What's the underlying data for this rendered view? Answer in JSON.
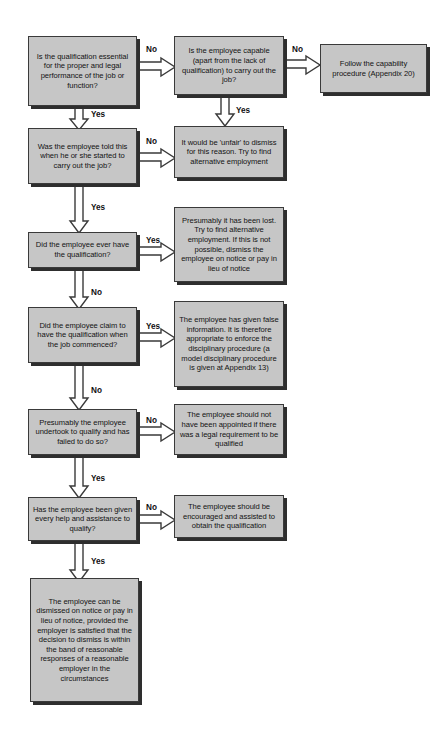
{
  "diagram": {
    "style": {
      "node_fill": "#c6c6c6",
      "node_border": "#3a3a3a",
      "node_shadow": "#2e2e2e",
      "arrow_fill": "#ffffff",
      "arrow_stroke": "#3a3a3a",
      "text_color": "#131313",
      "background": "#ffffff"
    },
    "nodes": [
      {
        "id": "q1",
        "type": "decision",
        "text": "Is the qualification essential for the proper and legal performance of the job or function?",
        "x": 28,
        "y": 36,
        "w": 109,
        "h": 70
      },
      {
        "id": "q2",
        "type": "decision",
        "text": "Is the employee capable (apart from the lack of qualification) to carry out the job?",
        "x": 174,
        "y": 36,
        "w": 110,
        "h": 59
      },
      {
        "id": "r1",
        "type": "outcome",
        "text": "Follow the capability procedure (Appendix 20)",
        "x": 320,
        "y": 44,
        "w": 107,
        "h": 49
      },
      {
        "id": "q3",
        "type": "decision",
        "text": "Was the employee told this when he or she started to carry out the job?",
        "x": 28,
        "y": 128,
        "w": 109,
        "h": 56
      },
      {
        "id": "r2",
        "type": "outcome",
        "text": "It would be 'unfair' to dismiss for this reason. Try to find alternative employment",
        "x": 174,
        "y": 126,
        "w": 110,
        "h": 52
      },
      {
        "id": "q4",
        "type": "decision",
        "text": "Did the employee ever have the qualification?",
        "x": 28,
        "y": 232,
        "w": 109,
        "h": 36
      },
      {
        "id": "r3",
        "type": "outcome",
        "text": "Presumably it has been lost. Try to find alternative employment. If this is not possible, dismiss the employee on notice or pay in lieu of notice",
        "x": 174,
        "y": 207,
        "w": 110,
        "h": 75
      },
      {
        "id": "q5",
        "type": "decision",
        "text": "Did the employee claim to have the qualification when the job commenced?",
        "x": 28,
        "y": 307,
        "w": 109,
        "h": 56
      },
      {
        "id": "r4",
        "type": "outcome",
        "text": "The employee has given false information. It is therefore appropriate to enforce the disciplinary procedure (a model disciplinary procedure is given at Appendix 13)",
        "x": 174,
        "y": 301,
        "w": 110,
        "h": 86
      },
      {
        "id": "q6",
        "type": "decision",
        "text": "Presumably the employee undertook to qualify and has failed to do so?",
        "x": 28,
        "y": 409,
        "w": 109,
        "h": 46
      },
      {
        "id": "r5",
        "type": "outcome",
        "text": "The employee should not have been appointed if there was a legal requirement to be qualified",
        "x": 174,
        "y": 404,
        "w": 110,
        "h": 51
      },
      {
        "id": "q7",
        "type": "decision",
        "text": "Has the employee been given every help and assistance to qualify?",
        "x": 28,
        "y": 497,
        "w": 109,
        "h": 44
      },
      {
        "id": "r6",
        "type": "outcome",
        "text": "The employee should be encouraged and assisted to obtain the qualification",
        "x": 174,
        "y": 495,
        "w": 110,
        "h": 43
      },
      {
        "id": "r7",
        "type": "outcome",
        "text": "The employee can be dismissed on notice or pay in lieu of notice, provided the employer is satisfied that the decision to dismiss is within the band of reasonable responses of a reasonable employer in the circumstances",
        "x": 30,
        "y": 578,
        "w": 109,
        "h": 124
      }
    ],
    "edges": [
      {
        "id": "e1",
        "from": "q1",
        "to": "q2",
        "label": "No",
        "label_x": 146,
        "label_y": 45
      },
      {
        "id": "e2",
        "from": "q2",
        "to": "r1",
        "label": "No",
        "label_x": 292,
        "label_y": 45
      },
      {
        "id": "e3",
        "from": "q1",
        "to": "q3",
        "label": "Yes",
        "label_x": 91,
        "label_y": 110
      },
      {
        "id": "e4",
        "from": "q2",
        "to": "r2",
        "label": "Yes",
        "label_x": 236,
        "label_y": 106
      },
      {
        "id": "e5",
        "from": "q3",
        "to": "r2",
        "label": "No",
        "label_x": 146,
        "label_y": 137
      },
      {
        "id": "e6",
        "from": "q3",
        "to": "q4",
        "label": "Yes",
        "label_x": 91,
        "label_y": 210
      },
      {
        "id": "e7",
        "from": "q4",
        "to": "r3",
        "label": "Yes",
        "label_x": 146,
        "label_y": 236
      },
      {
        "id": "e8",
        "from": "q4",
        "to": "q5",
        "label": "No",
        "label_x": 91,
        "label_y": 288
      },
      {
        "id": "e9",
        "from": "q5",
        "to": "r4",
        "label": "Yes",
        "label_x": 146,
        "label_y": 325
      },
      {
        "id": "e10",
        "from": "q5",
        "to": "q6",
        "label": "No",
        "label_x": 91,
        "label_y": 388
      },
      {
        "id": "e11",
        "from": "q6",
        "to": "r5",
        "label": "No",
        "label_x": 146,
        "label_y": 413
      },
      {
        "id": "e12",
        "from": "q6",
        "to": "q7",
        "label": "Yes",
        "label_x": 91,
        "label_y": 474
      },
      {
        "id": "e13",
        "from": "q7",
        "to": "r6",
        "label": "No",
        "label_x": 146,
        "label_y": 501
      },
      {
        "id": "e14",
        "from": "q7",
        "to": "r7",
        "label": "Yes",
        "label_x": 91,
        "label_y": 557
      }
    ]
  }
}
